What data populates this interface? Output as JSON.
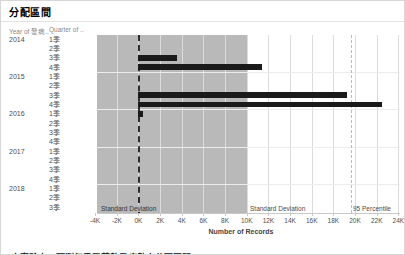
{
  "title": "分配區間",
  "columns": {
    "year_header": "Year of 發病..",
    "quarter_header": "Quarter of .."
  },
  "chart_data": {
    "type": "bar",
    "orientation": "horizontal",
    "title": "分配區間",
    "xlabel": "Number of Records",
    "x_ticks": [
      "-4K",
      "-2K",
      "0K",
      "2K",
      "4K",
      "6K",
      "8K",
      "10K",
      "12K",
      "14K",
      "16K",
      "18K",
      "20K",
      "22K",
      "24K"
    ],
    "x_tick_values": [
      -4000,
      -2000,
      0,
      2000,
      4000,
      6000,
      8000,
      10000,
      12000,
      14000,
      16000,
      18000,
      20000,
      22000,
      24000
    ],
    "axis_range": [
      -3830,
      24150
    ],
    "grid": "vertical-light",
    "bar_color": "#1a1a1a",
    "band_color": "#b9b9b9",
    "rows": [
      {
        "year": "2014",
        "quarter": "1季",
        "value": 0
      },
      {
        "year": "2014",
        "quarter": "2季",
        "value": 0
      },
      {
        "year": "2014",
        "quarter": "3季",
        "value": 3600
      },
      {
        "year": "2014",
        "quarter": "4季",
        "value": 11400
      },
      {
        "year": "2015",
        "quarter": "1季",
        "value": 0
      },
      {
        "year": "2015",
        "quarter": "2季",
        "value": 0
      },
      {
        "year": "2015",
        "quarter": "3季",
        "value": 19300
      },
      {
        "year": "2015",
        "quarter": "4季",
        "value": 22500
      },
      {
        "year": "2016",
        "quarter": "1季",
        "value": 450
      },
      {
        "year": "2016",
        "quarter": "2季",
        "value": 0
      },
      {
        "year": "2016",
        "quarter": "3季",
        "value": 0
      },
      {
        "year": "2016",
        "quarter": "4季",
        "value": 0
      },
      {
        "year": "2017",
        "quarter": "1季",
        "value": 0
      },
      {
        "year": "2017",
        "quarter": "2季",
        "value": 0
      },
      {
        "year": "2017",
        "quarter": "3季",
        "value": 0
      },
      {
        "year": "2017",
        "quarter": "4季",
        "value": 0
      },
      {
        "year": "2018",
        "quarter": "1季",
        "value": 0
      },
      {
        "year": "2018",
        "quarter": "2季",
        "value": 0
      },
      {
        "year": "2018",
        "quarter": "3季",
        "value": 0
      }
    ],
    "reference_lines": {
      "std_dev_band": {
        "from": -3830,
        "to": 10100,
        "label_left": "Standard Deviation",
        "label_right": "Standard Deviation"
      },
      "zero_line": {
        "value": 0,
        "style": "dashed-dark"
      },
      "percentile_95": {
        "value": 19600,
        "label": "95 Percentile"
      }
    }
  },
  "caption_clipped": "本實驗中，預測每季登革熱發病數之分配區間"
}
